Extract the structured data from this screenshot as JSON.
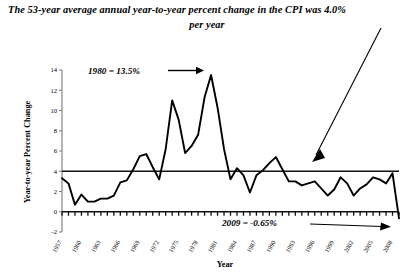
{
  "title": {
    "line1": "The 53-year average annual year-to-year percent change in the CPI was 4.0%",
    "line2": "per year"
  },
  "axes": {
    "xlabel": "Year",
    "ylabel": "Year-to-year Percent Change"
  },
  "annotations": {
    "peak_1980": "1980 = 13.5%",
    "last_2009": "2009 = -0.65%"
  },
  "chart_data": {
    "type": "line",
    "title": "The 53-year average annual year-to-year percent change in the CPI was 4.0% per year",
    "xlabel": "Year",
    "ylabel": "Year-to-year Percent Change",
    "xlim": [
      1957,
      2009
    ],
    "ylim": [
      -2,
      14
    ],
    "yticks": [
      -2,
      0,
      2,
      4,
      6,
      8,
      10,
      12,
      14
    ],
    "xticks": [
      1957,
      1960,
      1963,
      1966,
      1969,
      1972,
      1975,
      1978,
      1981,
      1984,
      1987,
      1990,
      1993,
      1996,
      1999,
      2002,
      2005,
      2008
    ],
    "xtick_labels": [
      "1957",
      "1960",
      "1963",
      "1966",
      "1969",
      "1972",
      "1975",
      "1978",
      "1981",
      "1984",
      "1987",
      "1990",
      "1993",
      "1996",
      "1999",
      "2002",
      "2005",
      "2008"
    ],
    "xtick_rotation": 60,
    "grid": false,
    "legend": false,
    "reference_lines": [
      {
        "name": "average",
        "value": 4.0,
        "label": "4.0% average",
        "orientation": "horizontal"
      },
      {
        "name": "zero-axis",
        "value": 0,
        "label": "0",
        "orientation": "horizontal"
      }
    ],
    "x": [
      1957,
      1958,
      1959,
      1960,
      1961,
      1962,
      1963,
      1964,
      1965,
      1966,
      1967,
      1968,
      1969,
      1970,
      1971,
      1972,
      1973,
      1974,
      1975,
      1976,
      1977,
      1978,
      1979,
      1980,
      1981,
      1982,
      1983,
      1984,
      1985,
      1986,
      1987,
      1988,
      1989,
      1990,
      1991,
      1992,
      1993,
      1994,
      1995,
      1996,
      1997,
      1998,
      1999,
      2000,
      2001,
      2002,
      2003,
      2004,
      2005,
      2006,
      2007,
      2008,
      2009
    ],
    "series": [
      {
        "name": "CPI year-to-year percent change",
        "values": [
          3.3,
          2.8,
          0.7,
          1.7,
          1.0,
          1.0,
          1.3,
          1.3,
          1.6,
          2.9,
          3.1,
          4.2,
          5.5,
          5.7,
          4.4,
          3.2,
          6.2,
          11.0,
          9.1,
          5.8,
          6.5,
          7.6,
          11.3,
          13.5,
          10.3,
          6.2,
          3.2,
          4.3,
          3.6,
          1.9,
          3.6,
          4.1,
          4.8,
          5.4,
          4.2,
          3.0,
          3.0,
          2.6,
          2.8,
          3.0,
          2.3,
          1.6,
          2.2,
          3.4,
          2.8,
          1.6,
          2.3,
          2.7,
          3.4,
          3.2,
          2.8,
          3.8,
          -0.65
        ]
      }
    ]
  }
}
